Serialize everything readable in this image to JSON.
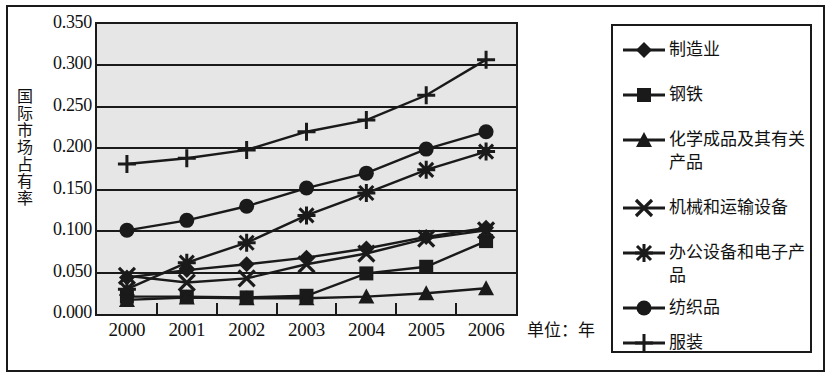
{
  "chart_data": {
    "type": "line",
    "title": "",
    "xlabel": "单位：年",
    "ylabel": "国际市场占有率",
    "categories": [
      "2000",
      "2001",
      "2002",
      "2003",
      "2004",
      "2005",
      "2006"
    ],
    "ylim": [
      0.0,
      0.35
    ],
    "ytick_labels": [
      "0.000",
      "0.050",
      "0.100",
      "0.150",
      "0.200",
      "0.250",
      "0.300",
      "0.350"
    ],
    "ytick_values": [
      0.0,
      0.05,
      0.1,
      0.15,
      0.2,
      0.25,
      0.3,
      0.35
    ],
    "grid": "horizontal",
    "legend_position": "right",
    "series": [
      {
        "name": "制造业",
        "marker": "diamond",
        "values": [
          0.044,
          0.053,
          0.06,
          0.068,
          0.079,
          0.093,
          0.104
        ]
      },
      {
        "name": "钢铁",
        "marker": "square",
        "values": [
          0.021,
          0.021,
          0.02,
          0.022,
          0.049,
          0.057,
          0.088
        ]
      },
      {
        "name": "化学成品及其有关产品",
        "marker": "triangle",
        "values": [
          0.017,
          0.02,
          0.019,
          0.019,
          0.021,
          0.025,
          0.031
        ]
      },
      {
        "name": "机械和运输设备",
        "marker": "x",
        "values": [
          0.046,
          0.038,
          0.043,
          0.06,
          0.073,
          0.091,
          0.101
        ]
      },
      {
        "name": "办公设备和电子产品",
        "marker": "asterisk",
        "values": [
          0.03,
          0.062,
          0.086,
          0.119,
          0.146,
          0.174,
          0.196
        ]
      },
      {
        "name": "纺织品",
        "marker": "circle",
        "values": [
          0.101,
          0.113,
          0.13,
          0.152,
          0.17,
          0.199,
          0.22
        ]
      },
      {
        "name": "服装",
        "marker": "plus",
        "values": [
          0.181,
          0.188,
          0.198,
          0.22,
          0.234,
          0.264,
          0.307
        ]
      }
    ],
    "colors": {
      "plot_background": "#e6e6e6",
      "line": "#1a1a1a",
      "grid": "#1a1a1a",
      "text": "#111111",
      "page_background": "#ffffff"
    }
  }
}
